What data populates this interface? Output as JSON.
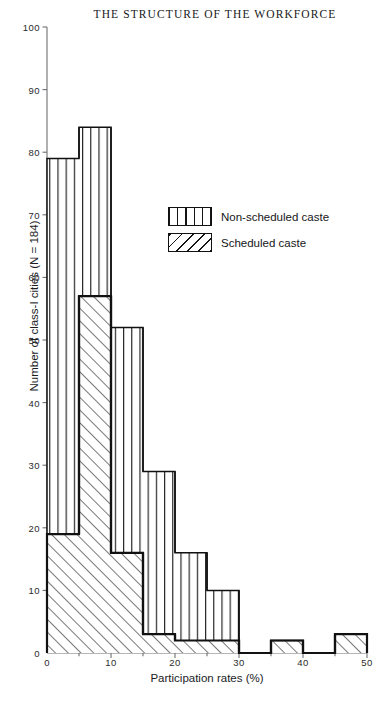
{
  "title": "THE STRUCTURE OF THE WORKFORCE",
  "axes": {
    "ylabel": "Number of class-I cities (N = 184)",
    "xlabel": "Participation rates (%)",
    "yticks": [
      0,
      10,
      20,
      30,
      40,
      50,
      60,
      70,
      80,
      90,
      100
    ],
    "xticks": [
      0,
      10,
      20,
      30,
      40,
      50
    ],
    "xminor": [
      5,
      15,
      25,
      35,
      45
    ]
  },
  "legend": {
    "items": [
      {
        "label": "Non-scheduled caste",
        "pattern": "vertical-lines"
      },
      {
        "label": "Scheduled caste",
        "pattern": "diagonal-lines"
      }
    ]
  },
  "colors": {
    "ink": "#111111",
    "axis": "#6e6f72",
    "background": "#ffffff"
  },
  "chart_data": {
    "type": "bar",
    "title": "THE STRUCTURE OF THE WORKFORCE",
    "xlabel": "Participation rates (%)",
    "ylabel": "Number of class-I cities (N = 184)",
    "xlim": [
      0,
      50
    ],
    "ylim": [
      0,
      100
    ],
    "grid": false,
    "legend_position": "upper-right-inside",
    "bin_width": 5,
    "bin_edges": [
      0,
      5,
      10,
      15,
      20,
      25,
      30,
      35,
      40,
      45,
      50
    ],
    "categories": [
      "0-5",
      "5-10",
      "10-15",
      "15-20",
      "20-25",
      "25-30",
      "30-35",
      "35-40",
      "40-45",
      "45-50"
    ],
    "series": [
      {
        "name": "Non-scheduled caste",
        "pattern": "vertical-lines",
        "values": [
          79,
          84,
          52,
          29,
          16,
          10,
          0,
          2,
          0,
          3
        ]
      },
      {
        "name": "Scheduled caste",
        "pattern": "diagonal-lines",
        "values": [
          19,
          57,
          16,
          3,
          2,
          2,
          0,
          2,
          0,
          3
        ]
      }
    ]
  }
}
